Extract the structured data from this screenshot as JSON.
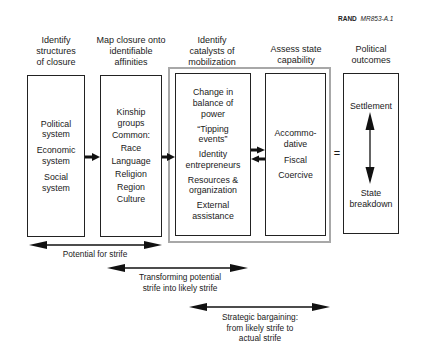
{
  "figure_id": {
    "org": "RAND",
    "code": "MR853-A.1"
  },
  "columns": [
    {
      "header": "Identify structures of closure",
      "header_lines": [
        "Identify",
        "structures",
        "of closure"
      ],
      "items": [
        "Political system",
        "Economic system",
        "Social system"
      ],
      "item_lines": [
        [
          "Political",
          "system"
        ],
        [
          "Economic",
          "system"
        ],
        [
          "Social",
          "system"
        ]
      ]
    },
    {
      "header": "Map closure onto identifiable affinities",
      "header_lines": [
        "Map closure onto",
        "identifiable",
        "affinities"
      ],
      "items": [
        "Kinship groups",
        "Common:",
        "Race",
        "Language",
        "Religion",
        "Region",
        "Culture"
      ],
      "item_lines": [
        [
          "Kinship",
          "groups"
        ],
        [
          "Common:"
        ],
        [
          "Race"
        ],
        [
          "Language"
        ],
        [
          "Religion"
        ],
        [
          "Region"
        ],
        [
          "Culture"
        ]
      ]
    },
    {
      "header": "Identify catalysts of mobilization",
      "header_lines": [
        "Identify",
        "catalysts of",
        "mobilization"
      ],
      "items": [
        "Change in balance of power",
        "“Tipping events”",
        "Identity entrepreneurs",
        "Resources & organization",
        "External assistance"
      ],
      "item_lines": [
        [
          "Change in",
          "balance of",
          "power"
        ],
        [
          "“Tipping",
          "events”"
        ],
        [
          "Identity",
          "entrepreneurs"
        ],
        [
          "Resources &",
          "organization"
        ],
        [
          "External",
          "assistance"
        ]
      ]
    },
    {
      "header": "Assess state capability",
      "header_lines": [
        "Assess state",
        "capability"
      ],
      "items": [
        "Accommodative",
        "Fiscal",
        "Coercive"
      ],
      "item_lines": [
        [
          "Accommo-",
          "dative"
        ],
        [
          "Fiscal"
        ],
        [
          "Coercive"
        ]
      ]
    },
    {
      "header": "Political outcomes",
      "header_lines": [
        "Political",
        "outcomes"
      ],
      "items": [
        "Settlement",
        "State breakdown"
      ],
      "item_lines": [
        [
          "Settlement"
        ],
        [
          "State",
          "breakdown"
        ]
      ]
    }
  ],
  "equals_sign": "=",
  "spans": [
    {
      "label": "Potential for strife",
      "label_lines": [
        "Potential for strife"
      ]
    },
    {
      "label": "Transforming potential strife into likely strife",
      "label_lines": [
        "Transforming potential",
        "strife into likely strife"
      ]
    },
    {
      "label": "Strategic bargaining: from likely strife to actual strife",
      "label_lines": [
        "Strategic bargaining:",
        "from likely strife to",
        "actual strife"
      ]
    }
  ],
  "colors": {
    "line": "#222222",
    "highlight_frame": "#a8a8a8",
    "background": "#ffffff"
  }
}
